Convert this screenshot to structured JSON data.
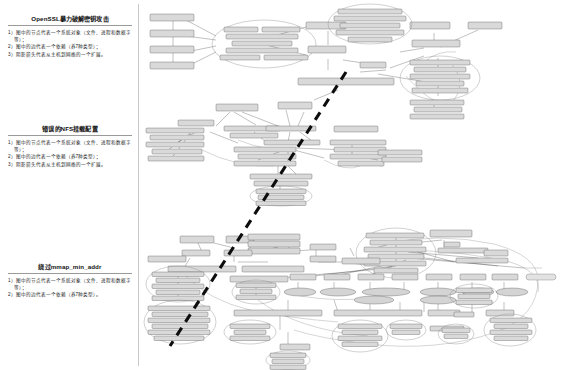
{
  "page": {
    "width": 565,
    "height": 370,
    "background": "#ffffff",
    "divider_color": "#c9c9c9"
  },
  "captions": [
    {
      "id": "openssl",
      "title": "OpenSSL暴力破解密钥攻击",
      "lines": [
        "1）图中的节点代表一个系统对象（文件、进程和数据字等）；",
        "2）图中的边代表一个依赖（养7种类型）；",
        "3）阴影箭头代表从主机到网络的一个扩展。"
      ]
    },
    {
      "id": "nfs",
      "title": "错误的NFS挂载配置",
      "lines": [
        "1）图中的节点代表一个系统对象（文件、进程和数据字等）；",
        "2）图中的边代表一个依赖（养7种类型）；",
        "3）阴影箭头代表从主机到网络的一个扩展。"
      ]
    },
    {
      "id": "mmap",
      "title": "绕过mmap_min_addr",
      "lines": [
        "1）图中的节点代表一个系统对象（文件、进程和数据字等）；",
        "2）图中的边代表一个依赖（养7种类型）。"
      ]
    }
  ],
  "diagram": {
    "name": "provenance-attack-graphs",
    "graph_count": 3,
    "graphs": [
      {
        "id": "graph-openssl",
        "label": "OpenSSL brute force key attack provenance graph"
      },
      {
        "id": "graph-nfs",
        "label": "NFS misconfiguration provenance graph"
      },
      {
        "id": "graph-mmap",
        "label": "mmap_min_addr bypass provenance graph"
      }
    ],
    "shadow_arrow": {
      "style": "thick-dashed",
      "color": "#0d0d0d",
      "description": "host-to-network expansion arrow"
    },
    "node_shapes": [
      "box",
      "ellipse"
    ],
    "node_fill": "#d9d9d9",
    "edge_color": "#3a3a3a"
  }
}
